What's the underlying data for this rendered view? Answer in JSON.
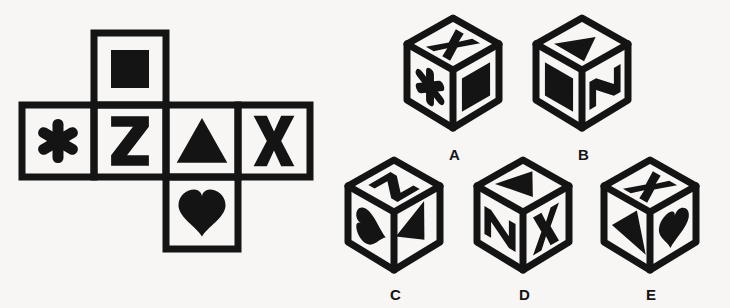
{
  "puzzle": {
    "kind": "cube-folding-visual-reasoning",
    "background_color": "#f7f6f4",
    "ink_color": "#141414"
  },
  "net": {
    "name": "unfolded-cube-net",
    "layout": "cross",
    "cells": [
      {
        "position": "top",
        "row": 0,
        "col": 1,
        "symbol": "square",
        "glyph": "■",
        "label": "filled-square"
      },
      {
        "position": "middle-left",
        "row": 1,
        "col": 0,
        "symbol": "asterisk",
        "glyph": "✳",
        "label": "asterisk"
      },
      {
        "position": "middle-left2",
        "row": 1,
        "col": 1,
        "symbol": "letter-z",
        "glyph": "Z",
        "label": "Z"
      },
      {
        "position": "middle-right2",
        "row": 1,
        "col": 2,
        "symbol": "triangle",
        "glyph": "▲",
        "label": "filled-triangle"
      },
      {
        "position": "middle-right",
        "row": 1,
        "col": 3,
        "symbol": "letter-x",
        "glyph": "X",
        "label": "X"
      },
      {
        "position": "bottom",
        "row": 2,
        "col": 2,
        "symbol": "heart",
        "glyph": "♥",
        "label": "filled-heart"
      }
    ]
  },
  "options": [
    {
      "id": "A",
      "label": "A",
      "faces": {
        "top": "letter-x",
        "left": "asterisk",
        "right": "square"
      },
      "face_glyphs": {
        "top": "X",
        "left": "✳",
        "right": "■"
      }
    },
    {
      "id": "B",
      "label": "B",
      "faces": {
        "top": "triangle",
        "left": "square",
        "right": "letter-z"
      },
      "face_glyphs": {
        "top": "▲",
        "left": "■",
        "right": "Z"
      }
    },
    {
      "id": "C",
      "label": "C",
      "faces": {
        "top": "letter-z",
        "left": "heart",
        "right": "triangle"
      },
      "face_glyphs": {
        "top": "Z",
        "left": "♥",
        "right": "▲"
      }
    },
    {
      "id": "D",
      "label": "D",
      "faces": {
        "top": "triangle",
        "left": "letter-z",
        "right": "letter-x"
      },
      "face_glyphs": {
        "top": "▲",
        "left": "Z",
        "right": "X"
      }
    },
    {
      "id": "E",
      "label": "E",
      "faces": {
        "top": "letter-x",
        "left": "triangle",
        "right": "heart"
      },
      "face_glyphs": {
        "top": "X",
        "left": "▲",
        "right": "♥"
      }
    }
  ]
}
